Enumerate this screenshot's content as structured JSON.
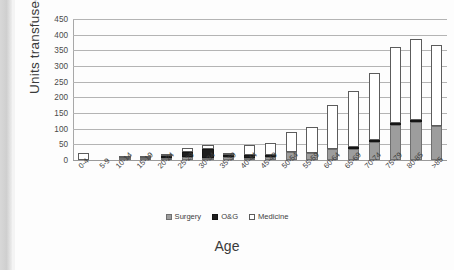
{
  "chart_data": {
    "type": "bar",
    "subtype": "stacked-vertical",
    "title": "",
    "xlabel": "Age",
    "ylabel": "Units transfused",
    "ylim": [
      0,
      450
    ],
    "ytick_step": 50,
    "yticks": [
      450,
      400,
      350,
      300,
      250,
      200,
      150,
      100,
      50,
      0
    ],
    "grid": true,
    "legend_position": "bottom",
    "categories": [
      "0-4",
      "5-9",
      "10-14",
      "15-19",
      "20-24",
      "25-29",
      "30-34",
      "35-39",
      "40-44",
      "45-49",
      "50-54",
      "55-59",
      "60-64",
      "65-69",
      "70-74",
      "75-79",
      "80-85",
      ">85"
    ],
    "series": [
      {
        "name": "Surgery",
        "color": "#9d9d9d",
        "values": [
          0,
          0,
          2,
          4,
          8,
          10,
          6,
          9,
          7,
          11,
          25,
          21,
          36,
          35,
          58,
          111,
          122,
          109
        ]
      },
      {
        "name": "O&G",
        "color": "#1f1f1f",
        "values": [
          0,
          0,
          0,
          0,
          2,
          15,
          28,
          2,
          10,
          1,
          0,
          0,
          0,
          2,
          6,
          6,
          5,
          0
        ]
      },
      {
        "name": "Medicine",
        "color": "#ffffff",
        "values": [
          22,
          0,
          1,
          4,
          5,
          12,
          12,
          8,
          31,
          36,
          63,
          83,
          141,
          178,
          214,
          244,
          259,
          258
        ]
      }
    ],
    "totals": [
      22,
      0,
      3,
      8,
      15,
      37,
      46,
      19,
      48,
      48,
      88,
      104,
      177,
      215,
      278,
      361,
      386,
      367
    ]
  },
  "legend": {
    "items": [
      {
        "label": "Surgery",
        "swatch": "surgery"
      },
      {
        "label": "O&G",
        "swatch": "og"
      },
      {
        "label": "Medicine",
        "swatch": "medicine"
      }
    ]
  }
}
